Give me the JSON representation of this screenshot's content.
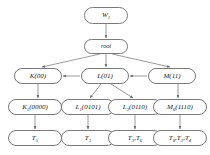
{
  "diagram": {
    "background_color": "#ffffff",
    "node_border_color": "#7a7a7a",
    "edge_color": "#6e6e6e",
    "text_color": "#1a1a1a",
    "rows": [
      {
        "row": 1,
        "nodes": [
          {
            "id": "w1",
            "label": "W",
            "subscript": "1",
            "suffix": "",
            "x": 84,
            "y": 7,
            "w": 44,
            "h": 17
          }
        ]
      },
      {
        "row": 2,
        "nodes": [
          {
            "id": "root",
            "label": "root",
            "subscript": "",
            "suffix": "",
            "x": 84,
            "y": 39,
            "w": 44,
            "h": 15
          }
        ]
      },
      {
        "row": 3,
        "nodes": [
          {
            "id": "k",
            "label": "K",
            "subscript": "",
            "suffix": "(00)",
            "x": 14,
            "y": 68,
            "w": 48,
            "h": 16
          },
          {
            "id": "l",
            "label": "L",
            "subscript": "",
            "suffix": "(01)",
            "x": 81,
            "y": 68,
            "w": 48,
            "h": 16
          },
          {
            "id": "m",
            "label": "M",
            "subscript": "",
            "suffix": "(11)",
            "x": 148,
            "y": 68,
            "w": 48,
            "h": 16
          }
        ]
      },
      {
        "row": 4,
        "nodes": [
          {
            "id": "k1",
            "label": "K",
            "subscript": "1",
            "suffix": "(0000)",
            "x": 8,
            "y": 99,
            "w": 54,
            "h": 16
          },
          {
            "id": "l1",
            "label": "L",
            "subscript": "1",
            "suffix": "(0101)",
            "x": 61,
            "y": 99,
            "w": 54,
            "h": 16
          },
          {
            "id": "l2",
            "label": "L",
            "subscript": "2",
            "suffix": "(0110)",
            "x": 108,
            "y": 99,
            "w": 54,
            "h": 16
          },
          {
            "id": "m6",
            "label": "M",
            "subscript": "6",
            "suffix": "(1110)",
            "x": 153,
            "y": 99,
            "w": 54,
            "h": 16
          }
        ]
      },
      {
        "row": 5,
        "nodes": [
          {
            "id": "t5",
            "label": "T",
            "subscript": "5",
            "suffix": "",
            "x": 8,
            "y": 130,
            "w": 54,
            "h": 16
          },
          {
            "id": "t1",
            "label": "T",
            "subscript": "1",
            "suffix": "",
            "x": 61,
            "y": 130,
            "w": 54,
            "h": 16
          },
          {
            "id": "t3t6",
            "label": "T",
            "subscript": "3",
            "suffix": ",T",
            "subscript2": "6",
            "x": 108,
            "y": 130,
            "w": 54,
            "h": 16
          },
          {
            "id": "t8t2t4",
            "label": "T",
            "subscript": "8",
            "suffix": ",T",
            "subscript2": "2",
            "suffix2": ",T",
            "subscript3": "4",
            "x": 153,
            "y": 130,
            "w": 54,
            "h": 16
          }
        ]
      }
    ],
    "edges": [
      {
        "from": "w1",
        "to": "root",
        "type": "vertical"
      },
      {
        "from": "root",
        "to": "k",
        "type": "diagonal"
      },
      {
        "from": "root",
        "to": "l",
        "type": "vertical"
      },
      {
        "from": "root",
        "to": "m",
        "type": "diagonal"
      },
      {
        "from": "m",
        "to": "l",
        "type": "horizontal"
      },
      {
        "from": "l",
        "to": "k",
        "type": "horizontal"
      },
      {
        "from": "k",
        "to": "k1",
        "type": "vertical"
      },
      {
        "from": "l",
        "to": "l1",
        "type": "diagonal"
      },
      {
        "from": "l",
        "to": "l2",
        "type": "diagonal"
      },
      {
        "from": "m",
        "to": "m6",
        "type": "vertical"
      },
      {
        "from": "m6",
        "to": "l2",
        "type": "horizontal"
      },
      {
        "from": "l2",
        "to": "l1",
        "type": "horizontal"
      },
      {
        "from": "l1",
        "to": "k1",
        "type": "horizontal"
      },
      {
        "from": "k1",
        "to": "t5",
        "type": "vertical"
      },
      {
        "from": "l1",
        "to": "t1",
        "type": "vertical"
      },
      {
        "from": "l2",
        "to": "t3t6",
        "type": "vertical"
      },
      {
        "from": "m6",
        "to": "t8t2t4",
        "type": "vertical"
      },
      {
        "from": "t8t2t4",
        "to": "t3t6",
        "type": "horizontal"
      },
      {
        "from": "t3t6",
        "to": "t1",
        "type": "horizontal"
      },
      {
        "from": "t1",
        "to": "t5",
        "type": "horizontal"
      }
    ]
  }
}
